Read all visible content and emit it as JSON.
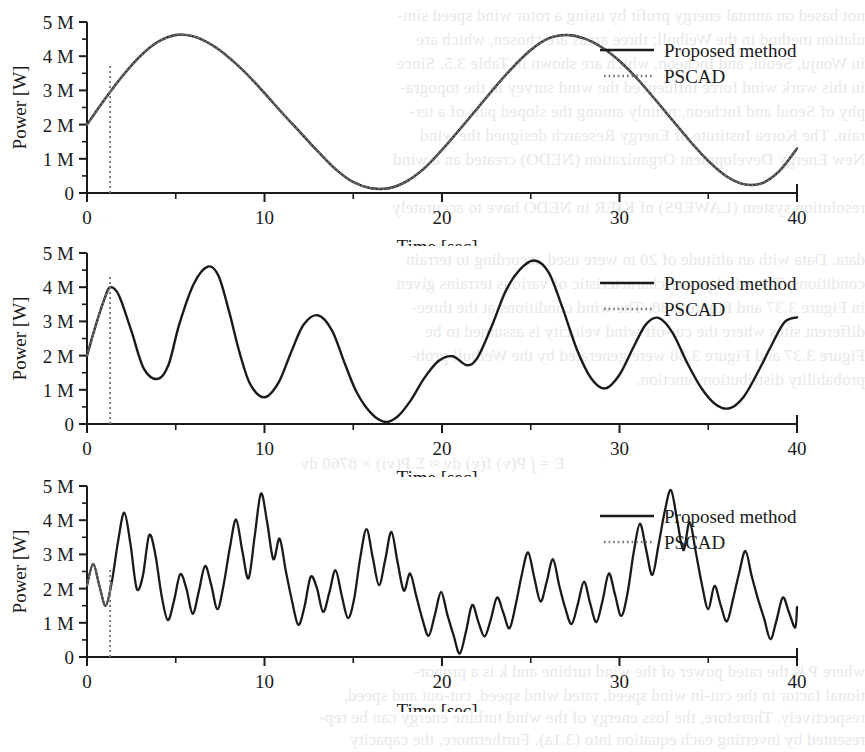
{
  "page": {
    "kind": "scanned-journal-page-figure",
    "background_color": "#ffffff",
    "ink_color": "#1a1a1a"
  },
  "bleed_through_text": {
    "note": "faint mirrored show-through from the reverse page side",
    "top_lines": [
      "not based on annual energy profit by using a rotor wind speed sim-",
      "ulation method in the Weibull; three areas are chosen, which are",
      "in Wonju, Seoul, and Incheon, which are shown in Table 3.5. Since",
      "in this work wind force influenced the wind survey in the topogra-",
      "phy of Seoul and Incheon, mainly among the sloped part of a ter-",
      "rain. The Korea Institute of Energy Research designed the wind",
      "New Energy Development Organization (NEDO) created an a wind",
      "resolution system (LAWEPS) of KIER in NEDO have to accurately",
      "data. Data with an altitude of 20 m were used according to terrain",
      "conditions. The wind power characteristic of various terrains given",
      "in Figure 3.37 and Figure 3.38. The wind conditions at the three-",
      "different sites where the cut-off wind velocity is assumed to be",
      "Figure 3.37 and Figure 3.38 were generated by the Weibull prob-",
      "probability distribution function."
    ],
    "bottom_lines": [
      "where P is the rated power of the wind turbine and k is a propor-",
      "tional factor in the cut-in wind speed, rated wind speed, cut-out and speed,",
      "respectively. Therefore, the loss energy of the wind turbine energy can be rep-",
      "resented by inverting each equation into (3.1a). Furthermore, the capacity"
    ],
    "formula_line": "E = ∫ P(v) f(v) dv ≈ Σ P(vi) × 8760 dv"
  },
  "legend": {
    "entries": [
      {
        "label": "Proposed method",
        "style": "solid",
        "color": "#1a1a1a"
      },
      {
        "label": "PSCAD",
        "style": "dotted",
        "color": "#555555"
      }
    ]
  },
  "axes": {
    "y_label": "Power [W]",
    "y_ticks": [
      "0",
      "1 M",
      "2 M",
      "3 M",
      "4 M",
      "5 M"
    ],
    "y_tick_values": [
      0,
      1,
      2,
      3,
      4,
      5
    ],
    "y_minor_per_major": 2,
    "x_label": "Time [sec]",
    "x_ticks": [
      "0",
      "10",
      "20",
      "30",
      "40"
    ],
    "x_tick_values": [
      0,
      10,
      20,
      30,
      40
    ],
    "x_minor_step": 5
  },
  "chart_data": [
    {
      "id": "figure-a",
      "type": "line",
      "title": "",
      "xlabel": "Time [sec]",
      "ylabel": "Power [W]",
      "xlim": [
        0,
        40
      ],
      "ylim": [
        0,
        5
      ],
      "y_unit": "M",
      "grid": false,
      "legend_position": "top-right",
      "pscad_marker_x": 1.3,
      "series": [
        {
          "name": "Proposed method",
          "style": "solid",
          "x": [
            0,
            1,
            2,
            3,
            4,
            5,
            6,
            7,
            8,
            9,
            10,
            11,
            12,
            13,
            14,
            15,
            16,
            17,
            18,
            19,
            20,
            21,
            22,
            23,
            24,
            25,
            26,
            27,
            28,
            29,
            30,
            31,
            32,
            33,
            34,
            35,
            36,
            37,
            38,
            39,
            40
          ],
          "y": [
            2.0,
            2.74,
            3.42,
            4.0,
            4.42,
            4.62,
            4.58,
            4.34,
            3.96,
            3.48,
            2.92,
            2.34,
            1.78,
            1.22,
            0.7,
            0.32,
            0.14,
            0.14,
            0.34,
            0.72,
            1.26,
            1.86,
            2.48,
            3.1,
            3.68,
            4.18,
            4.52,
            4.62,
            4.52,
            4.26,
            3.86,
            3.34,
            2.74,
            2.12,
            1.5,
            0.94,
            0.5,
            0.26,
            0.28,
            0.64,
            1.3
          ]
        },
        {
          "name": "PSCAD",
          "style": "dotted",
          "x": [
            0,
            1,
            2,
            3,
            4,
            5,
            6,
            7,
            8,
            9,
            10,
            11,
            12,
            13,
            14,
            15,
            16,
            17,
            18,
            19,
            20,
            21,
            22,
            23,
            24,
            25,
            26,
            27,
            28,
            29,
            30,
            31,
            32,
            33,
            34,
            35,
            36,
            37,
            38,
            39,
            40
          ],
          "y": [
            2.0,
            2.74,
            3.42,
            4.0,
            4.42,
            4.62,
            4.58,
            4.34,
            3.96,
            3.48,
            2.92,
            2.34,
            1.78,
            1.22,
            0.7,
            0.32,
            0.14,
            0.14,
            0.34,
            0.72,
            1.26,
            1.86,
            2.48,
            3.1,
            3.68,
            4.18,
            4.52,
            4.62,
            4.52,
            4.26,
            3.86,
            3.34,
            2.74,
            2.12,
            1.5,
            0.94,
            0.5,
            0.26,
            0.28,
            0.64,
            1.3
          ]
        }
      ]
    },
    {
      "id": "figure-b",
      "type": "line",
      "title": "",
      "xlabel": "Time [sec]",
      "ylabel": "Power [W]",
      "xlim": [
        0,
        40
      ],
      "ylim": [
        0,
        5
      ],
      "y_unit": "M",
      "grid": false,
      "legend_position": "top-right",
      "pscad_marker_x": 1.3,
      "series": [
        {
          "name": "Proposed method",
          "style": "solid",
          "x": [
            0,
            0.5,
            1,
            1.3,
            1.8,
            2.5,
            3.2,
            4,
            4.6,
            5.2,
            6,
            6.8,
            7.4,
            8,
            8.6,
            9.2,
            10,
            10.8,
            11.5,
            12.2,
            13,
            13.8,
            14.5,
            15.2,
            16,
            16.8,
            17.5,
            18.2,
            19,
            19.8,
            20.6,
            21.4,
            22,
            22.8,
            23.6,
            24.4,
            25.2,
            26,
            26.8,
            27.6,
            28.4,
            29.2,
            30,
            30.8,
            31.5,
            32.2,
            33,
            33.8,
            34.6,
            35.4,
            36.2,
            37,
            37.8,
            38.6,
            39.3,
            40
          ],
          "y": [
            2.0,
            2.9,
            3.68,
            4.0,
            3.76,
            2.72,
            1.62,
            1.32,
            1.74,
            2.92,
            4.08,
            4.6,
            4.34,
            3.3,
            2.08,
            1.16,
            0.78,
            1.22,
            2.1,
            2.9,
            3.18,
            2.74,
            1.8,
            0.92,
            0.32,
            0.06,
            0.22,
            0.66,
            1.34,
            1.84,
            1.98,
            1.72,
            1.94,
            2.86,
            3.9,
            4.52,
            4.78,
            4.44,
            3.38,
            2.18,
            1.34,
            1.04,
            1.44,
            2.26,
            2.92,
            3.1,
            2.66,
            1.8,
            1.06,
            0.58,
            0.46,
            0.8,
            1.52,
            2.34,
            2.98,
            3.12
          ]
        },
        {
          "name": "PSCAD",
          "style": "dotted",
          "x": [
            0,
            0.5,
            1,
            1.3
          ],
          "y": [
            2.0,
            2.9,
            3.68,
            4.0
          ]
        }
      ]
    },
    {
      "id": "figure-c",
      "type": "line",
      "title": "",
      "xlabel": "Time [sec]",
      "ylabel": "Power [W]",
      "xlim": [
        0,
        40
      ],
      "ylim": [
        0,
        5
      ],
      "y_unit": "M",
      "grid": false,
      "legend_position": "top-right",
      "pscad_marker_x": 1.3,
      "series": [
        {
          "name": "Proposed method",
          "style": "solid",
          "x": [
            0,
            0.35,
            0.7,
            1.05,
            1.4,
            1.75,
            2.1,
            2.45,
            2.8,
            3.15,
            3.5,
            3.85,
            4.2,
            4.55,
            4.9,
            5.25,
            5.6,
            5.95,
            6.3,
            6.65,
            7,
            7.35,
            7.7,
            8.05,
            8.4,
            8.75,
            9.1,
            9.45,
            9.8,
            10.15,
            10.5,
            10.85,
            11.2,
            11.55,
            11.9,
            12.25,
            12.6,
            12.95,
            13.3,
            13.65,
            14,
            14.35,
            14.7,
            15.05,
            15.4,
            15.75,
            16.1,
            16.45,
            16.8,
            17.15,
            17.5,
            17.85,
            18.2,
            18.55,
            18.9,
            19.25,
            19.6,
            19.95,
            20.3,
            20.65,
            21,
            21.35,
            21.7,
            22.05,
            22.4,
            22.75,
            23.1,
            23.45,
            23.8,
            24.15,
            24.5,
            24.85,
            25.2,
            25.55,
            25.9,
            26.25,
            26.6,
            26.95,
            27.3,
            27.65,
            28,
            28.35,
            28.7,
            29.05,
            29.4,
            29.75,
            30.1,
            30.45,
            30.8,
            31.15,
            31.5,
            31.85,
            32.2,
            32.55,
            32.9,
            33.25,
            33.6,
            33.95,
            34.3,
            34.65,
            35,
            35.35,
            35.7,
            36.05,
            36.4,
            36.75,
            37.1,
            37.45,
            37.8,
            38.15,
            38.5,
            38.85,
            39.2,
            39.55,
            39.9,
            40
          ],
          "y": [
            2.1,
            2.72,
            2.08,
            1.5,
            2.2,
            3.38,
            4.22,
            3.3,
            2.0,
            2.38,
            3.56,
            3.0,
            1.8,
            1.08,
            1.64,
            2.42,
            2.0,
            1.26,
            1.92,
            2.66,
            2.1,
            1.4,
            2.12,
            3.2,
            4.02,
            3.1,
            2.3,
            3.54,
            4.78,
            3.94,
            2.86,
            3.46,
            2.52,
            1.64,
            0.94,
            1.46,
            2.34,
            2.02,
            1.32,
            1.88,
            2.54,
            1.8,
            1.14,
            1.7,
            2.92,
            3.74,
            2.9,
            2.1,
            2.84,
            3.66,
            2.76,
            1.94,
            2.44,
            1.78,
            1.1,
            0.62,
            1.24,
            1.9,
            1.24,
            0.64,
            0.1,
            0.74,
            1.52,
            1.02,
            0.6,
            1.1,
            1.74,
            1.3,
            0.84,
            1.52,
            2.42,
            3.06,
            2.32,
            1.62,
            2.2,
            2.86,
            2.1,
            1.42,
            0.96,
            1.54,
            2.2,
            1.56,
            1.02,
            1.66,
            2.44,
            1.82,
            1.2,
            1.86,
            3.06,
            3.9,
            3.14,
            2.4,
            3.28,
            4.26,
            4.88,
            4.0,
            3.12,
            3.94,
            3.06,
            2.1,
            1.4,
            2.08,
            1.52,
            1.04,
            1.7,
            2.48,
            3.1,
            2.36,
            1.7,
            1.12,
            0.52,
            1.08,
            1.74,
            1.3,
            0.86,
            1.46,
            2.0
          ]
        },
        {
          "name": "PSCAD",
          "style": "dotted",
          "x": [
            0,
            0.35,
            0.7,
            1.05,
            1.4
          ],
          "y": [
            2.1,
            2.72,
            2.08,
            1.5,
            2.2
          ]
        }
      ]
    }
  ]
}
